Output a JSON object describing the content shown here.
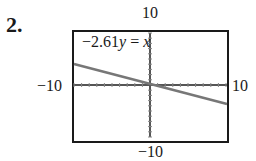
{
  "problem": {
    "number": "2."
  },
  "chart_data": {
    "type": "line",
    "title": "",
    "equation": "-2.61y = x",
    "series": [
      {
        "name": "-2.61y = x",
        "x": [
          -10,
          10
        ],
        "y": [
          3.83,
          -3.83
        ],
        "color": "#777777"
      }
    ],
    "xlim": [
      -10,
      10
    ],
    "ylim": [
      -10,
      10
    ],
    "window_labels": {
      "top": "10",
      "bottom": "-10",
      "left": "-10",
      "right": "10"
    },
    "xlabel": "",
    "ylabel": "",
    "grid": false,
    "axes_tick_marks": true
  },
  "labels": {
    "top": "10",
    "bottom": "−10",
    "left": "−10",
    "right": "10",
    "eq_prefix": "−2.61",
    "eq_y": "y",
    "eq_mid": " = ",
    "eq_x": "x"
  }
}
